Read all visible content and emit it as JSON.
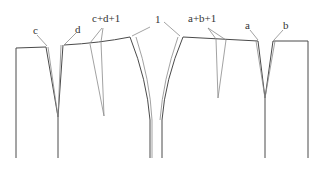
{
  "diagram": {
    "type": "skirt-pattern-dart-manipulation",
    "stroke_color": "#4a4a4a",
    "thin_stroke_color": "#8a8a8a",
    "labels": [
      {
        "id": "c",
        "text": "c",
        "x": 33,
        "y": 25
      },
      {
        "id": "d",
        "text": "d",
        "x": 75,
        "y": 24
      },
      {
        "id": "cd1",
        "text": "c+d+1",
        "x": 92,
        "y": 13
      },
      {
        "id": "one",
        "text": "1",
        "x": 155,
        "y": 14
      },
      {
        "id": "ab1",
        "text": "a+b+1",
        "x": 188,
        "y": 13
      },
      {
        "id": "a",
        "text": "a",
        "x": 245,
        "y": 20
      },
      {
        "id": "b",
        "text": "b",
        "x": 283,
        "y": 20
      }
    ]
  }
}
